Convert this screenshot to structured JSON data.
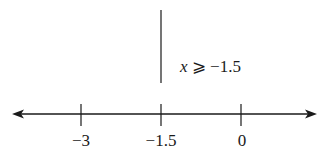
{
  "diagram": {
    "type": "number-line",
    "inequality": {
      "variable": "x",
      "operator": "⩾",
      "value": "−1.5"
    },
    "ticks": [
      {
        "label": "−3",
        "value": -3
      },
      {
        "label": "−1.5",
        "value": -1.5
      },
      {
        "label": "0",
        "value": 0
      }
    ],
    "boundary_value": -1.5,
    "line_color": "#1a1a1a"
  }
}
